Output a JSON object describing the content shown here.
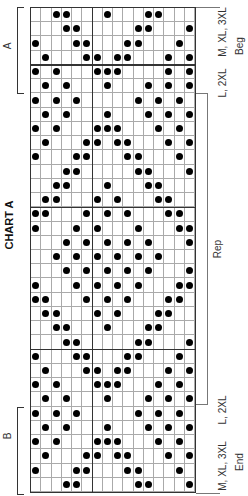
{
  "title": "CHART A",
  "left_labels": {
    "bracket_a": "A",
    "bracket_b": "B"
  },
  "right_labels": {
    "top_size": "M, XL, 3XL",
    "top_size_2": "L, 2XL",
    "beg": "Beg",
    "rep": "Rep",
    "bottom_size_2": "L, 2XL",
    "bottom_size": "M, XL, 3XL",
    "end": "End"
  },
  "grid": {
    "columns": 16,
    "rows": 34,
    "thick_col_after": [
      6
    ],
    "thick_row_after": [
      4,
      14,
      24
    ],
    "symbol": "filled-dot",
    "dots_by_row": [
      [
        3,
        4,
        8,
        12,
        13
      ],
      [
        4,
        5,
        11,
        12,
        16
      ],
      [
        1,
        5,
        6,
        10,
        11,
        15
      ],
      [
        2,
        6,
        7,
        9,
        10,
        14,
        16
      ],
      [
        1,
        3,
        7,
        8,
        9,
        14,
        16
      ],
      [
        2,
        4,
        8,
        12,
        14,
        16
      ],
      [
        1,
        3,
        5,
        11,
        13,
        15
      ],
      [
        2,
        4,
        8,
        12,
        14,
        16
      ],
      [
        1,
        3,
        7,
        8,
        9,
        13,
        15
      ],
      [
        2,
        6,
        7,
        9,
        10,
        14,
        16
      ],
      [
        1,
        5,
        6,
        10,
        11,
        15
      ],
      [
        4,
        5,
        11,
        12,
        16
      ],
      [
        3,
        4,
        8,
        12,
        13
      ],
      [
        2,
        3,
        7,
        9,
        13,
        14
      ],
      [
        1,
        2,
        6,
        8,
        10,
        14,
        15
      ],
      [
        1,
        5,
        7,
        11,
        15,
        16
      ],
      [
        4,
        6,
        8,
        10,
        12,
        16
      ],
      [
        3,
        5,
        7,
        9,
        11,
        13
      ],
      [
        4,
        6,
        8,
        10,
        12,
        16
      ],
      [
        1,
        5,
        7,
        9,
        11,
        15,
        16
      ],
      [
        1,
        2,
        6,
        8,
        10,
        14,
        15
      ],
      [
        2,
        3,
        7,
        9,
        13,
        14
      ],
      [
        3,
        4,
        8,
        12,
        13
      ],
      [
        4,
        5,
        11,
        12,
        16
      ],
      [
        1,
        5,
        6,
        10,
        11,
        15
      ],
      [
        2,
        6,
        7,
        9,
        10,
        14,
        16
      ],
      [
        1,
        3,
        7,
        8,
        9,
        13,
        15
      ],
      [
        2,
        4,
        8,
        12,
        14,
        16
      ],
      [
        1,
        3,
        5,
        11,
        13,
        15
      ],
      [
        2,
        4,
        8,
        12,
        14,
        16
      ],
      [
        1,
        3,
        7,
        8,
        9,
        13,
        15
      ],
      [
        2,
        6,
        7,
        9,
        10,
        14,
        16
      ],
      [
        1,
        5,
        6,
        10,
        11,
        15
      ],
      [
        4,
        5,
        11,
        12,
        16
      ]
    ]
  }
}
